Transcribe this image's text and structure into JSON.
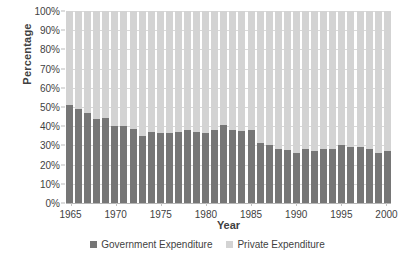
{
  "chart_data": {
    "type": "bar",
    "subtype": "stacked-100-percent",
    "title": "",
    "xlabel": "Year",
    "ylabel": "Percentage",
    "ylim": [
      0,
      100
    ],
    "ytick_labels": [
      "0%",
      "10%",
      "20%",
      "30%",
      "40%",
      "50%",
      "60%",
      "70%",
      "80%",
      "90%",
      "100%"
    ],
    "ytick_values": [
      0,
      10,
      20,
      30,
      40,
      50,
      60,
      70,
      80,
      90,
      100
    ],
    "xtick_labels": [
      "1965",
      "1970",
      "1975",
      "1980",
      "1985",
      "1990",
      "1995",
      "2000"
    ],
    "xtick_values": [
      1965,
      1970,
      1975,
      1980,
      1985,
      1990,
      1995,
      2000
    ],
    "grid": true,
    "legend_position": "bottom-center",
    "categories": [
      "1965",
      "1966",
      "1967",
      "1968",
      "1969",
      "1970",
      "1971",
      "1972",
      "1973",
      "1974",
      "1975",
      "1976",
      "1977",
      "1978",
      "1979",
      "1980",
      "1981",
      "1982",
      "1983",
      "1984",
      "1985",
      "1986",
      "1987",
      "1988",
      "1989",
      "1990",
      "1991",
      "1992",
      "1993",
      "1994",
      "1995",
      "1996",
      "1997",
      "1998",
      "1999",
      "2000"
    ],
    "series": [
      {
        "name": "Government Expenditure",
        "color": "#767676",
        "values": [
          51,
          49,
          47,
          44,
          44.5,
          40,
          40,
          38.5,
          35,
          37,
          36.5,
          36.5,
          37,
          38,
          37,
          36.5,
          38,
          40.5,
          38,
          37.5,
          38,
          31.5,
          30,
          28,
          27.5,
          26,
          28,
          27,
          28,
          28,
          30,
          29,
          29,
          28,
          26,
          27
        ]
      },
      {
        "name": "Private Expenditure",
        "color": "#d3d3d3",
        "values": [
          49,
          51,
          53,
          56,
          55.5,
          60,
          60,
          61.5,
          65,
          63,
          63.5,
          63.5,
          63,
          62,
          63,
          63.5,
          62,
          59.5,
          62,
          62.5,
          62,
          68.5,
          70,
          72,
          72.5,
          74,
          72,
          73,
          72,
          72,
          70,
          71,
          71,
          72,
          74,
          73
        ]
      }
    ]
  },
  "legend": {
    "items": [
      {
        "label": "Government Expenditure",
        "color": "#767676"
      },
      {
        "label": "Private Expenditure",
        "color": "#d3d3d3"
      }
    ]
  }
}
